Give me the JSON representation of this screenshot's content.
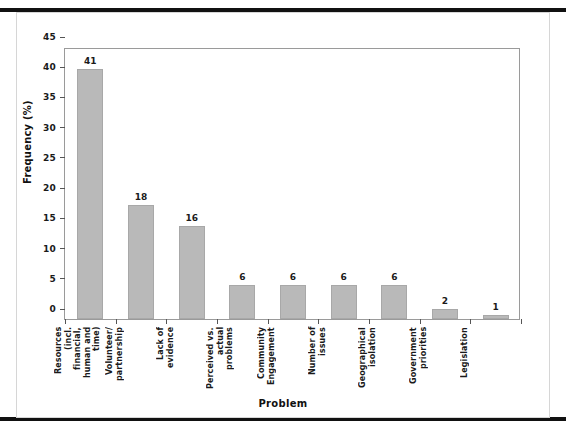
{
  "figure": {
    "background_color": "#ffffff",
    "rule_color": "#111111",
    "frame_color": "#d6d6d6",
    "axis_color": "#9a9a9a",
    "bar_color": "#b9b9b9",
    "bar_border_color": "#a8a8a8"
  },
  "chart_data": {
    "type": "bar",
    "title": "",
    "xlabel": "Problem",
    "ylabel": "Frequency (%)",
    "categories": [
      "Resources (incl. financial, human and time)",
      "Volunteer/ partnership",
      "Lack of evidence",
      "Perceived vs. actual problems",
      "Community Engagement",
      "Number of issues",
      "Geographical isolation",
      "Government priorities",
      "Legislation"
    ],
    "values": [
      41,
      18,
      16,
      6,
      6,
      6,
      6,
      2,
      1
    ],
    "bar_heights_pct": [
      41.4,
      18.9,
      15.4,
      5.7,
      5.7,
      5.7,
      5.7,
      1.6,
      0.7
    ],
    "value_labels": [
      "41",
      "18",
      "16",
      "6",
      "6",
      "6",
      "6",
      "2",
      "1"
    ],
    "ylim": [
      0,
      45
    ],
    "yticks": [
      0,
      5,
      10,
      15,
      20,
      25,
      30,
      35,
      40,
      45
    ],
    "ytick_labels": [
      "0",
      "5",
      "10",
      "15",
      "20",
      "25",
      "30",
      "35",
      "40",
      "45"
    ],
    "grid": false,
    "legend": null,
    "legend_position": "none"
  }
}
